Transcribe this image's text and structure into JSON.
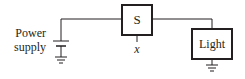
{
  "diagram": {
    "type": "circuit",
    "nodes": [
      {
        "id": "power-supply",
        "label_lines": [
          "Power",
          "supply"
        ],
        "kind": "battery"
      },
      {
        "id": "switch",
        "label": "S",
        "kind": "box",
        "control_label": "x"
      },
      {
        "id": "light",
        "label": "Light",
        "kind": "box"
      }
    ],
    "edges": [
      {
        "from": "power-supply",
        "to": "switch"
      },
      {
        "from": "switch",
        "to": "light"
      },
      {
        "from": "power-supply",
        "to": "ground"
      },
      {
        "from": "light",
        "to": "ground"
      }
    ],
    "colors": {
      "stroke": "#231f20",
      "background": "#ffffff"
    }
  },
  "labels": {
    "power_line1": "Power",
    "power_line2": "supply",
    "switch": "S",
    "control": "x",
    "light": "Light"
  }
}
